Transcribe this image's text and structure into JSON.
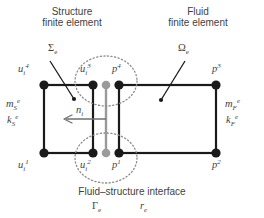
{
  "figure": {
    "type": "diagram",
    "background_color": "#ffffff",
    "line_color": "#1a1a1a",
    "interface_color": "#9a9a9a",
    "dotted_color": "#8c8c8c",
    "text_color": "#3f3f3f"
  },
  "titles": {
    "structure_line1": "Structure",
    "structure_line2": "finite element",
    "fluid_line1": "Fluid",
    "fluid_line2": "finite element"
  },
  "domain_labels": {
    "structure_domain": "Σ",
    "structure_domain_sub": "e",
    "fluid_domain": "Ω",
    "fluid_domain_sub": "e"
  },
  "properties": {
    "structure_mass": "m",
    "structure_mass_sub": "S",
    "structure_mass_sup": "e",
    "structure_stiffness": "k",
    "structure_stiffness_sub": "S",
    "structure_stiffness_sup": "e",
    "fluid_mass": "m",
    "fluid_mass_sub": "F",
    "fluid_mass_sup": "e",
    "fluid_stiffness": "k",
    "fluid_stiffness_sub": "F",
    "fluid_stiffness_sup": "e"
  },
  "normal": {
    "symbol": "n",
    "sub": "i",
    "direction": "left"
  },
  "interface": {
    "caption": "Fluid–structure interface",
    "gamma": "Γ",
    "gamma_sub": "e",
    "r": "r",
    "r_sub": "e"
  },
  "nodes": [
    {
      "id": "u4",
      "symbol": "u",
      "sub": "i",
      "sup": "4",
      "kind": "structure",
      "color": "#1a1a1a",
      "x": 44,
      "y": 85,
      "label_x": 18,
      "label_y": 66
    },
    {
      "id": "u3",
      "symbol": "u",
      "sub": "i",
      "sup": "3",
      "kind": "structure",
      "color": "#1a1a1a",
      "x": 93,
      "y": 85,
      "label_x": 80,
      "label_y": 66
    },
    {
      "id": "u1",
      "symbol": "u",
      "sub": "i",
      "sup": "1",
      "kind": "structure",
      "color": "#1a1a1a",
      "x": 44,
      "y": 153,
      "label_x": 18,
      "label_y": 158
    },
    {
      "id": "u2",
      "symbol": "u",
      "sub": "i",
      "sup": "2",
      "kind": "structure",
      "color": "#1a1a1a",
      "x": 93,
      "y": 153,
      "label_x": 80,
      "label_y": 158
    },
    {
      "id": "i_top",
      "symbol": "",
      "sub": "",
      "sup": "",
      "kind": "interface",
      "color": "#9a9a9a",
      "x": 106,
      "y": 85,
      "label_x": 0,
      "label_y": 0
    },
    {
      "id": "i_bot",
      "symbol": "",
      "sub": "",
      "sup": "",
      "kind": "interface",
      "color": "#9a9a9a",
      "x": 106,
      "y": 153,
      "label_x": 0,
      "label_y": 0
    },
    {
      "id": "p4",
      "symbol": "p",
      "sub": "",
      "sup": "4",
      "kind": "fluid",
      "color": "#1a1a1a",
      "x": 119,
      "y": 85,
      "label_x": 112,
      "label_y": 66
    },
    {
      "id": "p1",
      "symbol": "p",
      "sub": "",
      "sup": "1",
      "kind": "fluid",
      "color": "#1a1a1a",
      "x": 119,
      "y": 153,
      "label_x": 112,
      "label_y": 158
    },
    {
      "id": "p3",
      "symbol": "p",
      "sub": "",
      "sup": "3",
      "kind": "fluid",
      "color": "#1a1a1a",
      "x": 216,
      "y": 85,
      "label_x": 212,
      "label_y": 66
    },
    {
      "id": "p2",
      "symbol": "p",
      "sub": "",
      "sup": "2",
      "kind": "fluid",
      "color": "#1a1a1a",
      "x": 216,
      "y": 153,
      "label_x": 212,
      "label_y": 158
    }
  ],
  "geometry": {
    "structure_rect": {
      "x": 44,
      "y": 85,
      "w": 49,
      "h": 68
    },
    "fluid_rect": {
      "x": 119,
      "y": 85,
      "w": 97,
      "h": 68
    },
    "interface_line": {
      "x": 106,
      "y1": 85,
      "y2": 153
    },
    "circle_top": {
      "cx": 106,
      "cy": 82,
      "rx": 30,
      "ry": 25
    },
    "circle_bottom": {
      "cx": 106,
      "cy": 157,
      "rx": 30,
      "ry": 25
    },
    "arrow": {
      "x_from": 106,
      "x_to": 64,
      "y": 119
    },
    "sigma_leader": {
      "x1": 50,
      "y1": 62,
      "x2": 74,
      "y2": 99
    },
    "omega_leader": {
      "x1": 185,
      "y1": 62,
      "x2": 161,
      "y2": 100
    }
  }
}
